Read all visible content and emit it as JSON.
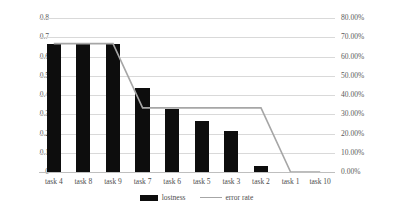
{
  "chart_data": {
    "type": "bar",
    "title": "",
    "xlabel": "",
    "ylabel": "",
    "categories": [
      "task 4",
      "task 8",
      "task 9",
      "task 7",
      "task 6",
      "task 5",
      "task 3",
      "task 2",
      "task 1",
      "task 10"
    ],
    "series": [
      {
        "name": "lostness",
        "type": "bar",
        "axis": "left",
        "color": "#0D0D0D",
        "values": [
          0.667,
          0.667,
          0.667,
          0.436,
          0.327,
          0.265,
          0.213,
          0.031,
          0,
          0
        ]
      },
      {
        "name": "error rate",
        "type": "line",
        "axis": "right",
        "color": "#A6A6A6",
        "values": [
          66.67,
          66.67,
          66.67,
          33.33,
          33.33,
          33.33,
          33.33,
          33.33,
          0,
          0
        ]
      }
    ],
    "left_axis": {
      "min": 0,
      "max": 0.8,
      "step": 0.1,
      "ticks": [
        "0.8",
        "0.7",
        "0.6",
        "0.5",
        "0.4",
        "0.3",
        "0.2",
        "0.1",
        "0"
      ]
    },
    "right_axis": {
      "min": 0,
      "max": 80,
      "step": 10,
      "ticks": [
        "80.00%",
        "70.00%",
        "60.00%",
        "50.00%",
        "40.00%",
        "30.00%",
        "20.00%",
        "10.00%",
        "0.00%"
      ]
    },
    "grid": "horizontal",
    "legend_position": "bottom-center",
    "legend": [
      {
        "label": "lostness",
        "marker": "bar-swatch"
      },
      {
        "label": "error rate",
        "marker": "line-swatch"
      }
    ]
  }
}
